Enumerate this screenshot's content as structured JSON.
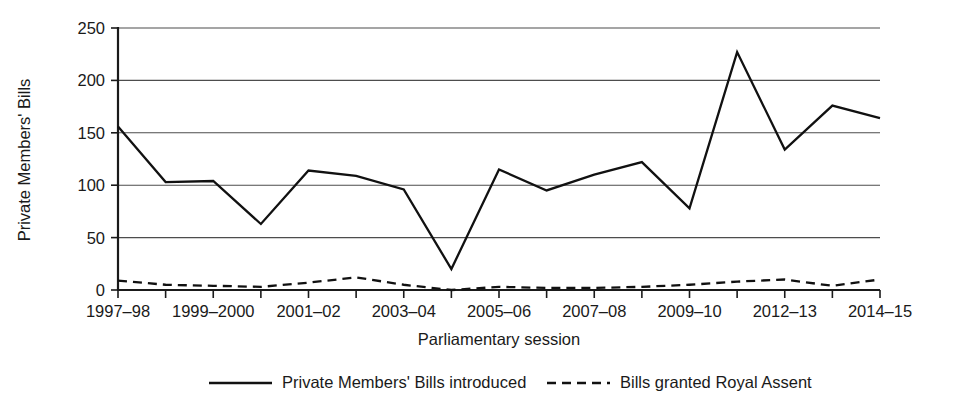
{
  "chart_data": {
    "type": "line",
    "title": "",
    "xlabel": "Parliamentary session",
    "ylabel": "Private Members' Bills",
    "ylim": [
      0,
      250
    ],
    "ytick_values": [
      0,
      50,
      100,
      150,
      200,
      250
    ],
    "ytick_labels": [
      "0",
      "50",
      "100",
      "150",
      "200",
      "250"
    ],
    "grid": true,
    "legend_position": "bottom",
    "categories": [
      "1997-98",
      "1998-99",
      "1999-2000",
      "2000-01",
      "2001-02",
      "2002-03",
      "2003-04",
      "2004-05",
      "2005-06",
      "2006-07",
      "2007-08",
      "2008-09",
      "2009-10",
      "2010-12",
      "2012-13",
      "2013-14",
      "2014-15"
    ],
    "xtick_labels_shown": [
      "1997–98",
      "1999–2000",
      "2001–02",
      "2003–04",
      "2005–06",
      "2007–08",
      "2009–10",
      "2012–13",
      "2014–15"
    ],
    "xtick_label_indices": [
      0,
      2,
      4,
      6,
      8,
      10,
      12,
      14,
      16
    ],
    "series": [
      {
        "name": "Private Members' Bills introduced",
        "style": "solid",
        "values": [
          156,
          103,
          104,
          63,
          114,
          109,
          96,
          20,
          115,
          95,
          110,
          122,
          78,
          227,
          134,
          176,
          164
        ]
      },
      {
        "name": "Bills granted Royal Assent",
        "style": "dashed",
        "values": [
          9,
          5,
          4,
          3,
          7,
          12,
          5,
          0,
          3,
          2,
          2,
          3,
          5,
          8,
          10,
          4,
          10
        ]
      }
    ]
  },
  "legend": {
    "entries": [
      {
        "label": "Private Members' Bills introduced",
        "style": "solid"
      },
      {
        "label": "Bills granted Royal Assent",
        "style": "dashed"
      }
    ]
  }
}
